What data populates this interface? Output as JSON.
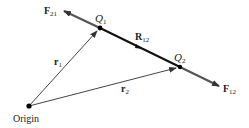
{
  "diagram": {
    "type": "vector-diagram",
    "points": {
      "origin": {
        "label": "Origin",
        "x": 29,
        "y": 106
      },
      "q1": {
        "label": "Q",
        "sub": "1",
        "x": 100,
        "y": 28
      },
      "q2": {
        "label": "Q",
        "sub": "2",
        "x": 180,
        "y": 67
      }
    },
    "vectors": {
      "r1": {
        "label": "r",
        "sub": "1"
      },
      "r2": {
        "label": "r",
        "sub": "2"
      },
      "r12": {
        "label": "R",
        "sub": "12"
      },
      "f21": {
        "label": "F",
        "sub": "21"
      },
      "f12": {
        "label": "F",
        "sub": "12"
      }
    },
    "colors": {
      "line": "#333333",
      "thick": "#111111",
      "force": "#555555"
    }
  }
}
